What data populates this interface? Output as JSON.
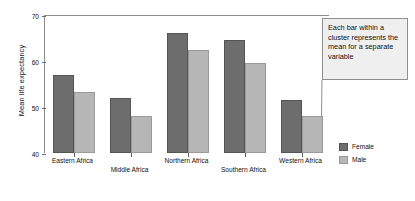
{
  "chart_data": {
    "type": "bar",
    "title": "",
    "xlabel": "",
    "ylabel": "Mean life expectancy",
    "ylim": [
      40,
      70
    ],
    "yticks": [
      40,
      50,
      60,
      70
    ],
    "grid": false,
    "legend_position": "right",
    "categories": [
      "Eastern Africa",
      "Middle Africa",
      "Northern Africa",
      "Southern Africa",
      "Western Africa"
    ],
    "series": [
      {
        "name": "Female",
        "color": "#6d6d6d",
        "values": [
          57.0,
          52.0,
          66.0,
          64.5,
          51.5
        ]
      },
      {
        "name": "Male",
        "color": "#b6b6b6",
        "values": [
          53.3,
          48.0,
          62.3,
          59.6,
          48.0
        ]
      }
    ],
    "annotations": [
      {
        "text": "Each bar within a cluster represents the mean for a separate variable",
        "target_series": "Male",
        "target_category": "Western Africa"
      }
    ]
  },
  "legend": {
    "items": [
      {
        "label": "Female",
        "swatch": "female"
      },
      {
        "label": "Male",
        "swatch": "male"
      }
    ]
  },
  "callout": {
    "text": "Each bar within a cluster represents the mean for a separate variable"
  }
}
